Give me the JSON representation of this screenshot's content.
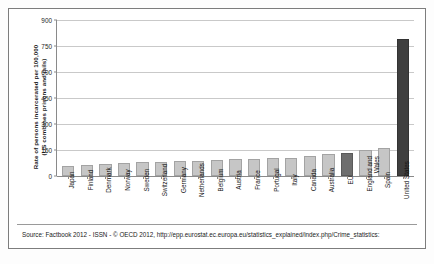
{
  "chart_data": {
    "type": "bar",
    "title": "",
    "xlabel": "",
    "ylabel_line1": "Rate of persons incarcerated per 100,000",
    "ylabel_line2": "(US combines prisons and jails)",
    "ylim": [
      0,
      900
    ],
    "yticks": [
      0,
      150,
      300,
      450,
      600,
      750,
      900
    ],
    "grid": true,
    "legend": "none",
    "categories": [
      "Japan",
      "Finland",
      "Denmark",
      "Norway",
      "Sweden",
      "Switzerland",
      "Germany",
      "Netherlands",
      "Belgium",
      "Austria",
      "France",
      "Portugal",
      "Italy",
      "Canada",
      "Australia",
      "EU",
      "England and Wales",
      "Spain",
      "United States"
    ],
    "values": [
      57,
      65,
      71,
      73,
      78,
      79,
      88,
      87,
      92,
      101,
      98,
      104,
      103,
      117,
      127,
      130,
      151,
      160,
      790
    ],
    "bar_styles": [
      "normal",
      "normal",
      "normal",
      "normal",
      "normal",
      "normal",
      "normal",
      "normal",
      "normal",
      "normal",
      "normal",
      "normal",
      "normal",
      "normal",
      "normal",
      "highlight",
      "normal",
      "normal",
      "dark"
    ],
    "colors": {
      "bar": "#c6c6c6",
      "bar_border": "#a3a3a3",
      "bar_highlight": "#6e6e6e",
      "bar_dark": "#3f3f3f",
      "gridline": "#c9c9c9",
      "axis": "#8a8a8a",
      "text": "#1a1a1a",
      "frame": "#7d7d7d"
    }
  },
  "source": {
    "text": "Source: Factbook 2012 - ISSN  - © OECD 2012, http://epp.eurostat.ec.europa.eu/statistics_explained/index.php/Crime_statistics:"
  }
}
